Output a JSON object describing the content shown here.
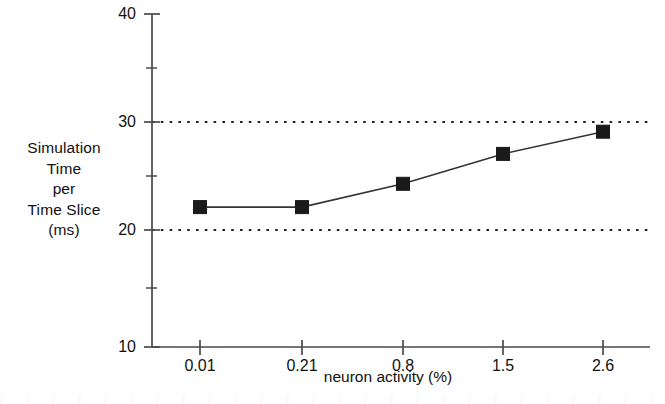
{
  "chart_data": {
    "type": "line",
    "title": "",
    "subtitle": "",
    "xlabel": "neuron activity (%)",
    "ylabel": "Simulation Time per Time Slice (ms)",
    "ylabel_lines": [
      "Simulation",
      "Time",
      "per",
      "Time Slice",
      "(ms)"
    ],
    "categories": [
      "0.01",
      "0.21",
      "0.8",
      "1.5",
      "2.6"
    ],
    "x": [
      0.01,
      0.21,
      0.8,
      1.5,
      2.6
    ],
    "values": [
      22.6,
      22.6,
      24.7,
      27.4,
      29.4
    ],
    "series": [
      {
        "name": "Simulation Time per Time Slice",
        "values": [
          22.6,
          22.6,
          24.7,
          27.4,
          29.4
        ],
        "marker": "filled-square",
        "marker_color": "#1a1a1a",
        "line_color": "#333333"
      }
    ],
    "ylim": [
      10,
      40
    ],
    "yticks_major": [
      10,
      20,
      30,
      40
    ],
    "yticks_major_labels": [
      "10",
      "20",
      "30",
      "40"
    ],
    "yticks_minor": [
      15,
      25,
      35
    ],
    "xtick_labels": [
      "0.01",
      "0.21",
      "0.8",
      "1.5",
      "2.6"
    ],
    "grid": "horizontal-dotted-at-20-and-30",
    "gridlines": [
      20,
      30
    ],
    "legend": null,
    "legend_position": "none",
    "axis_color": "#444444",
    "background_color": "#ffffff"
  },
  "axes": {
    "y_axis_name": "y-axis",
    "x_axis_name": "x-axis"
  }
}
